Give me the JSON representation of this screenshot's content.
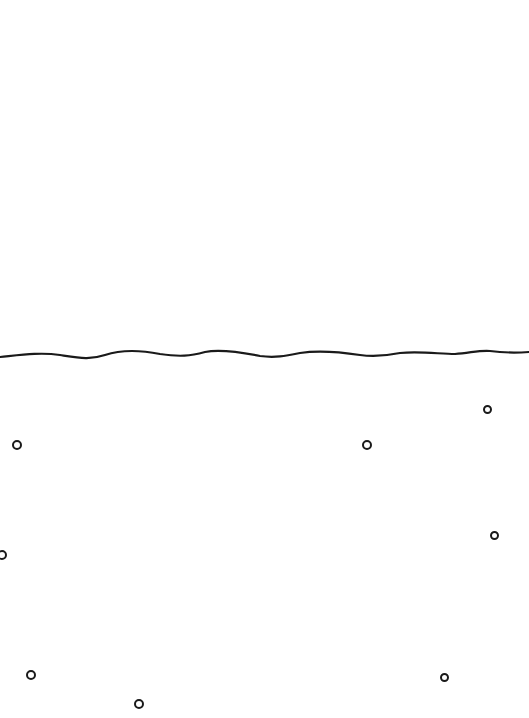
{
  "scene": {
    "background": "#ffffff",
    "ink": "#1a1a1a",
    "wave": {
      "path": "M0,357 C20,355 40,352 60,355 C80,358 90,360 105,355 C120,350 140,350 160,354 C180,357 190,356 205,352 C220,349 240,352 260,356 C275,358 285,356 300,353 C320,350 340,352 360,355 C375,357 385,356 400,353 C420,351 440,354 455,354 C470,353 480,350 490,351 C505,353 515,353 529,352"
    },
    "bubbles": [
      {
        "x": 17,
        "y": 445,
        "d": 10
      },
      {
        "x": 2,
        "y": 555,
        "d": 10
      },
      {
        "x": 367,
        "y": 445,
        "d": 10
      },
      {
        "x": 487,
        "y": 409,
        "d": 9
      },
      {
        "x": 494,
        "y": 535,
        "d": 9
      },
      {
        "x": 31,
        "y": 675,
        "d": 10
      },
      {
        "x": 139,
        "y": 704,
        "d": 10
      },
      {
        "x": 444,
        "y": 677,
        "d": 9
      }
    ]
  }
}
